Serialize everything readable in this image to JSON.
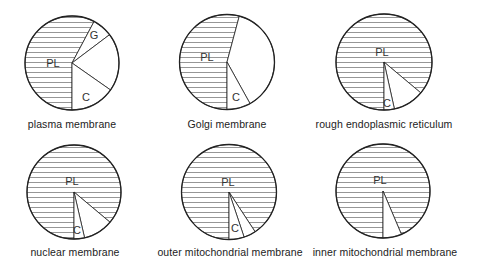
{
  "figure": {
    "legend_keys": {
      "PL": "hatched region",
      "C": "segment labeled C",
      "G": "segment labeled G"
    },
    "colors": {
      "outline": "#222222",
      "hatch": "#8a8a8a",
      "background": "#ffffff"
    }
  },
  "charts": [
    {
      "caption": "plasma membrane",
      "cx": 72,
      "cy": 63,
      "r": 47,
      "slices": [
        {
          "label": "PL",
          "start": 180,
          "end": 388,
          "hatched": true,
          "label_x": 53,
          "label_y": 67
        },
        {
          "label": "G",
          "start": 28,
          "end": 53,
          "hatched": false,
          "label_x": 94,
          "label_y": 39
        },
        {
          "label": "",
          "start": 53,
          "end": 125,
          "hatched": false
        },
        {
          "label": "C",
          "start": 125,
          "end": 180,
          "hatched": false,
          "label_x": 86,
          "label_y": 101
        }
      ],
      "caption_x": 72,
      "caption_y": 118
    },
    {
      "caption": "Golgi membrane",
      "cx": 227,
      "cy": 62,
      "r": 47.5,
      "slices": [
        {
          "label": "PL",
          "start": 180,
          "end": 375,
          "hatched": true,
          "label_x": 207,
          "label_y": 61
        },
        {
          "label": "",
          "start": 15,
          "end": 151,
          "hatched": false
        },
        {
          "label": "C",
          "start": 151,
          "end": 180,
          "hatched": false,
          "label_x": 236,
          "label_y": 101
        }
      ],
      "caption_x": 227,
      "caption_y": 118
    },
    {
      "caption": "rough endoplasmic reticulum",
      "cx": 384,
      "cy": 62,
      "r": 48,
      "slices": [
        {
          "label": "PL",
          "start": 180,
          "end": 490,
          "hatched": true,
          "label_x": 382,
          "label_y": 56
        },
        {
          "label": "",
          "start": 130,
          "end": 167.5,
          "hatched": false
        },
        {
          "label": "C",
          "start": 167.5,
          "end": 180,
          "hatched": false,
          "label_x": 387,
          "label_y": 107
        }
      ],
      "caption_x": 384,
      "caption_y": 118
    },
    {
      "caption": "nuclear membrane",
      "cx": 74,
      "cy": 192,
      "r": 47,
      "slices": [
        {
          "label": "PL",
          "start": 180,
          "end": 490,
          "hatched": true,
          "label_x": 72,
          "label_y": 185
        },
        {
          "label": "",
          "start": 130,
          "end": 167,
          "hatched": false
        },
        {
          "label": "C",
          "start": 167,
          "end": 180,
          "hatched": false,
          "label_x": 77,
          "label_y": 234
        }
      ],
      "caption_x": 75,
      "caption_y": 246
    },
    {
      "caption": "outer mitochondrial membrane",
      "cx": 229,
      "cy": 192,
      "r": 47.5,
      "slices": [
        {
          "label": "PL",
          "start": 180,
          "end": 506.7,
          "hatched": true,
          "label_x": 228,
          "label_y": 186
        },
        {
          "label": "",
          "start": 146.7,
          "end": 161.5,
          "hatched": false
        },
        {
          "label": "C",
          "start": 161.5,
          "end": 180,
          "hatched": false,
          "label_x": 235,
          "label_y": 232
        }
      ],
      "caption_x": 230,
      "caption_y": 246
    },
    {
      "caption": "inner mitochondrial membrane",
      "cx": 383,
      "cy": 191,
      "r": 47,
      "slices": [
        {
          "label": "PL",
          "start": 180,
          "end": 517,
          "hatched": true,
          "label_x": 380,
          "label_y": 184
        },
        {
          "label": "",
          "start": 157,
          "end": 180,
          "hatched": false
        }
      ],
      "caption_x": 385,
      "caption_y": 246
    }
  ],
  "chart_data": [
    {
      "type": "pie",
      "title": "plasma membrane",
      "categories": [
        "PL",
        "G",
        "unlabeled",
        "C"
      ],
      "values": [
        58,
        7,
        20,
        15
      ]
    },
    {
      "type": "pie",
      "title": "Golgi membrane",
      "categories": [
        "PL",
        "unlabeled",
        "C"
      ],
      "values": [
        54,
        38,
        8
      ]
    },
    {
      "type": "pie",
      "title": "rough endoplasmic reticulum",
      "categories": [
        "PL",
        "unlabeled",
        "C"
      ],
      "values": [
        86,
        10,
        4
      ]
    },
    {
      "type": "pie",
      "title": "nuclear membrane",
      "categories": [
        "PL",
        "unlabeled",
        "C"
      ],
      "values": [
        86,
        10,
        4
      ]
    },
    {
      "type": "pie",
      "title": "outer mitochondrial membrane",
      "categories": [
        "PL",
        "unlabeled",
        "C"
      ],
      "values": [
        91,
        4,
        5
      ]
    },
    {
      "type": "pie",
      "title": "inner mitochondrial membrane",
      "categories": [
        "PL",
        "unlabeled"
      ],
      "values": [
        94,
        6
      ]
    }
  ]
}
